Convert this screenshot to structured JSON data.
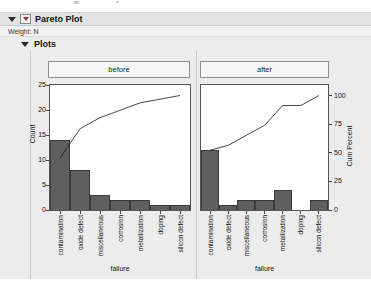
{
  "outline": {
    "title": "Pareto Plot",
    "weight_label": "Weight: N",
    "plots_label": "Plots"
  },
  "icons": {
    "disclosure": "down-filled-triangle",
    "red_triangle_menu": "red-triangle-in-box"
  },
  "colors": {
    "report_bg": "#ececec",
    "bar_fill": "#5f5f5f",
    "bar_border": "#3b3b3b",
    "cum_line": "#1a1a1a",
    "frame_border": "#555555",
    "red_triangle": "#993333"
  },
  "chart_data": [
    {
      "type": "bar",
      "subtype": "pareto",
      "panel": "before",
      "categories": [
        "contamination",
        "oxide defect",
        "miscellaneous",
        "corrosion",
        "metallization",
        "doping",
        "silicon defect"
      ],
      "values": [
        14,
        8,
        3,
        2,
        2,
        1,
        1
      ],
      "total": 31,
      "cum_percent": [
        45.2,
        71.0,
        80.6,
        87.1,
        93.5,
        96.8,
        100
      ],
      "xlabel": "failure",
      "ylabel": "Count",
      "ylim": [
        0,
        25
      ],
      "yticks": [
        0,
        5,
        10,
        15,
        20,
        25
      ],
      "grid": false,
      "legend": "none"
    },
    {
      "type": "bar",
      "subtype": "pareto",
      "panel": "after",
      "categories": [
        "contamination",
        "oxide defect",
        "miscellaneous",
        "corrosion",
        "metallization",
        "doping",
        "silicon defect"
      ],
      "values": [
        12,
        1,
        2,
        2,
        4,
        0,
        2
      ],
      "total": 23,
      "cum_percent": [
        52.2,
        56.5,
        65.2,
        73.9,
        91.3,
        91.3,
        100
      ],
      "xlabel": "failure",
      "y2label": "Cum Percent",
      "y2lim": [
        0,
        100
      ],
      "y2ticks": [
        0,
        25,
        50,
        75,
        100
      ],
      "grid": false,
      "legend": "none"
    }
  ]
}
